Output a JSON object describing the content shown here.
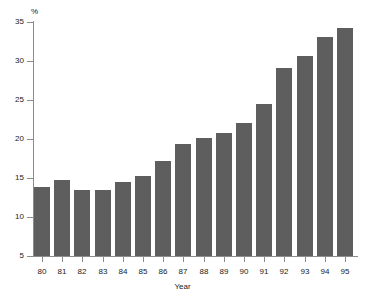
{
  "chart_data": {
    "type": "bar",
    "title": "",
    "subtitle": "",
    "xlabel": "Year",
    "ylabel": "%",
    "categories": [
      "80",
      "81",
      "82",
      "83",
      "84",
      "85",
      "86",
      "87",
      "88",
      "89",
      "90",
      "91",
      "92",
      "93",
      "94",
      "95"
    ],
    "values": [
      13.9,
      14.8,
      13.4,
      13.4,
      14.5,
      15.3,
      17.2,
      19.3,
      20.1,
      20.8,
      22.1,
      24.5,
      29.1,
      30.7,
      33.1,
      34.2
    ],
    "ylim": [
      5,
      35
    ],
    "ytick_labels": [
      "5",
      "10",
      "15",
      "20",
      "25",
      "30",
      "35"
    ],
    "ytick_values": [
      5,
      10,
      15,
      20,
      25,
      30,
      35
    ],
    "grid": false,
    "legend": null,
    "legend_position": "none",
    "bar_color": "#5e5e5e",
    "axis_color": "#8c8c8c",
    "background_color": "#ffffff"
  }
}
